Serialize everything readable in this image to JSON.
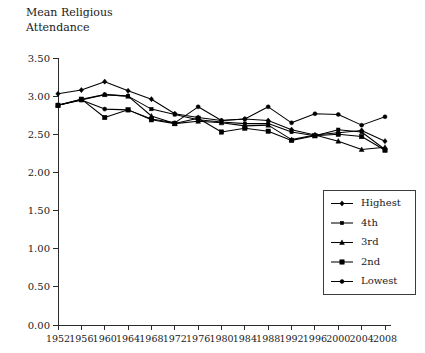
{
  "chart_data": {
    "type": "line",
    "title": "",
    "ylabel": "Mean Religious Attendance",
    "ylabel_line1": "Mean Religious",
    "ylabel_line2": "Attendance",
    "xlabel": "",
    "ylim": [
      0.0,
      3.5
    ],
    "ytick_labels": [
      "0.00",
      "0.50",
      "1.00",
      "1.50",
      "2.00",
      "2.50",
      "3.00",
      "3.50"
    ],
    "ytick_values": [
      0.0,
      0.5,
      1.0,
      1.5,
      2.0,
      2.5,
      3.0,
      3.5
    ],
    "grid": false,
    "legend_position": "bottom-right",
    "categories": [
      1952,
      1956,
      1960,
      1964,
      1968,
      1972,
      1976,
      1980,
      1984,
      1988,
      1992,
      1996,
      2000,
      2004,
      2008
    ],
    "xtick_labels": [
      "1952",
      "1956",
      "1960",
      "1964",
      "1968",
      "1972",
      "1976",
      "1980",
      "1984",
      "1988",
      "1992",
      "1996",
      "2000",
      "2004",
      "2008"
    ],
    "series": [
      {
        "name": "Highest",
        "marker": "diamond",
        "color": "#000000",
        "values": [
          3.03,
          3.08,
          3.19,
          3.07,
          2.96,
          2.77,
          2.72,
          2.68,
          2.7,
          2.68,
          2.56,
          2.49,
          2.52,
          2.55,
          2.41
        ]
      },
      {
        "name": "4th",
        "marker": "square-small",
        "color": "#000000",
        "values": [
          2.88,
          2.96,
          3.02,
          3.0,
          2.83,
          2.76,
          2.69,
          2.66,
          2.64,
          2.64,
          2.53,
          2.48,
          2.56,
          2.53,
          2.3
        ]
      },
      {
        "name": "3rd",
        "marker": "triangle",
        "color": "#000000",
        "values": [
          2.88,
          2.95,
          3.02,
          3.0,
          2.74,
          2.64,
          2.67,
          2.65,
          2.61,
          2.62,
          2.43,
          2.49,
          2.41,
          2.3,
          2.33
        ]
      },
      {
        "name": "2nd",
        "marker": "square",
        "color": "#000000",
        "values": [
          2.88,
          2.96,
          2.72,
          2.82,
          2.69,
          2.64,
          2.71,
          2.53,
          2.58,
          2.54,
          2.42,
          2.48,
          2.5,
          2.47,
          2.29
        ]
      },
      {
        "name": "Lowest",
        "marker": "circle",
        "color": "#000000",
        "values": [
          2.88,
          2.95,
          2.83,
          2.82,
          2.7,
          2.65,
          2.86,
          2.68,
          2.7,
          2.86,
          2.65,
          2.77,
          2.76,
          2.62,
          2.73
        ]
      }
    ]
  },
  "legend": {
    "items": [
      {
        "label": "Highest"
      },
      {
        "label": "4th"
      },
      {
        "label": "3rd"
      },
      {
        "label": "2nd"
      },
      {
        "label": "Lowest"
      }
    ]
  }
}
